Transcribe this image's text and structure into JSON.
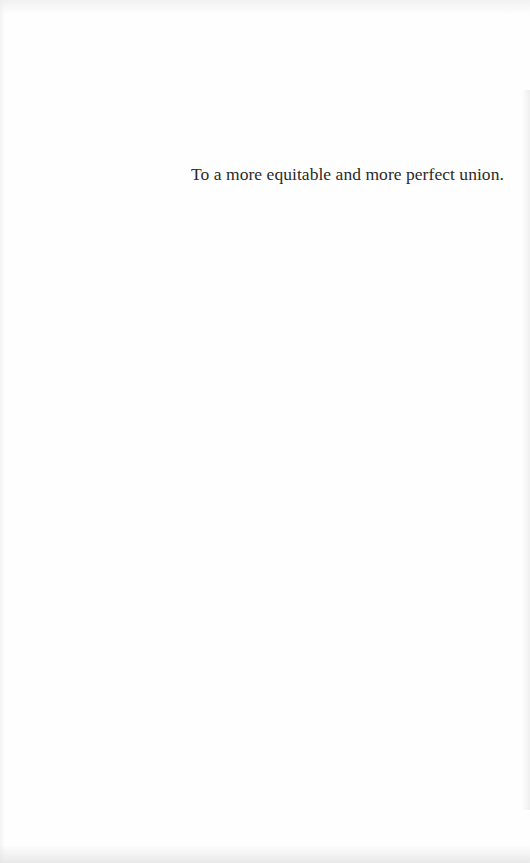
{
  "page": {
    "type": "dedication",
    "dedication_text": "To a more equitable and more perfect union."
  },
  "colors": {
    "background": "#fefefe",
    "text": "#2a2a2a"
  }
}
